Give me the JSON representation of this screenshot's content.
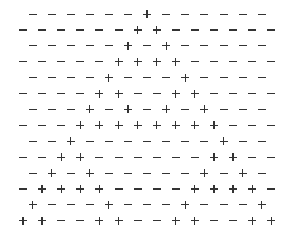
{
  "pattern": {
    "rows": [
      "------+------",
      "------++------",
      "-----+-+-----",
      "-----++++-----",
      "----+---+----",
      "----++--++----",
      "---+-+-+-+---",
      "---++++++++---",
      "--+-------+--",
      "--++------++--",
      "-+-+-----+-+-",
      "-++++----++++-",
      "+---+---+---+",
      "++--++--++--++"
    ],
    "symbols": {
      "+": "plus-sign",
      "-": "minus-sign"
    }
  }
}
